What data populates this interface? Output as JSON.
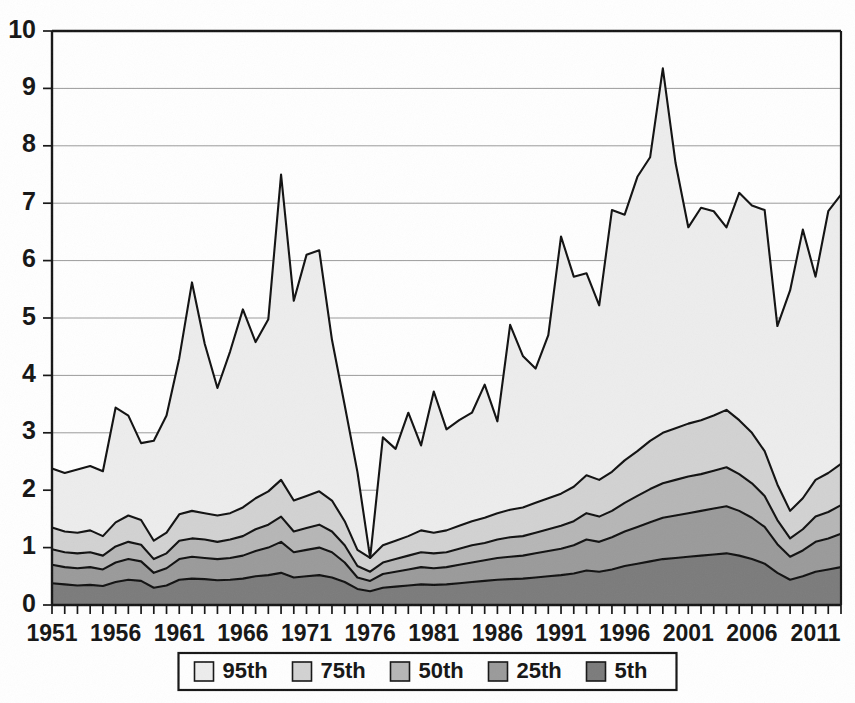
{
  "chart_data": {
    "type": "area",
    "stacked": true,
    "title": "",
    "subtitle": "",
    "xlabel": "",
    "ylabel": "",
    "xlim": [
      1951,
      2013
    ],
    "ylim": [
      0,
      10
    ],
    "ytick_values": [
      0,
      1,
      2,
      3,
      4,
      5,
      6,
      7,
      8,
      9,
      10
    ],
    "ytick_labels": [
      "0",
      "1",
      "2",
      "3",
      "4",
      "5",
      "6",
      "7",
      "8",
      "9",
      "10"
    ],
    "xtick_labels": [
      "1951",
      "1956",
      "1961",
      "1966",
      "1971",
      "1976",
      "1981",
      "1986",
      "1991",
      "1996",
      "2001",
      "2006",
      "2011"
    ],
    "xtick_values": [
      1951,
      1956,
      1961,
      1966,
      1971,
      1976,
      1981,
      1986,
      1991,
      1996,
      2001,
      2006,
      2011
    ],
    "minor_xticks_every": 1,
    "grid": {
      "horizontal": true,
      "vertical": false
    },
    "legend": {
      "position": "bottom-center",
      "entries": [
        {
          "label": "95th",
          "color": "#ededed"
        },
        {
          "label": "75th",
          "color": "#d2d2d2"
        },
        {
          "label": "50th",
          "color": "#b6b6b6"
        },
        {
          "label": "25th",
          "color": "#9a9a9a"
        },
        {
          "label": "5th",
          "color": "#7b7b7b"
        }
      ]
    },
    "x": [
      1951,
      1952,
      1953,
      1954,
      1955,
      1956,
      1957,
      1958,
      1959,
      1960,
      1961,
      1962,
      1963,
      1964,
      1965,
      1966,
      1967,
      1968,
      1969,
      1970,
      1971,
      1972,
      1973,
      1974,
      1975,
      1976,
      1977,
      1978,
      1979,
      1980,
      1981,
      1982,
      1983,
      1984,
      1985,
      1986,
      1987,
      1988,
      1989,
      1990,
      1991,
      1992,
      1993,
      1994,
      1995,
      1996,
      1997,
      1998,
      1999,
      2000,
      2001,
      2002,
      2003,
      2004,
      2005,
      2006,
      2007,
      2008,
      2009,
      2010,
      2011,
      2012,
      2013
    ],
    "series": [
      {
        "name": "5th",
        "values": [
          0.38,
          0.36,
          0.34,
          0.35,
          0.33,
          0.4,
          0.44,
          0.42,
          0.3,
          0.34,
          0.44,
          0.46,
          0.45,
          0.43,
          0.44,
          0.46,
          0.5,
          0.52,
          0.56,
          0.48,
          0.5,
          0.52,
          0.48,
          0.4,
          0.28,
          0.24,
          0.3,
          0.32,
          0.34,
          0.36,
          0.35,
          0.36,
          0.38,
          0.4,
          0.42,
          0.44,
          0.45,
          0.46,
          0.48,
          0.5,
          0.52,
          0.55,
          0.6,
          0.58,
          0.62,
          0.68,
          0.72,
          0.76,
          0.8,
          0.82,
          0.84,
          0.86,
          0.88,
          0.9,
          0.86,
          0.8,
          0.72,
          0.56,
          0.44,
          0.5,
          0.58,
          0.62,
          0.66
        ]
      },
      {
        "name": "25th",
        "values": [
          0.7,
          0.66,
          0.64,
          0.66,
          0.62,
          0.74,
          0.8,
          0.76,
          0.56,
          0.64,
          0.8,
          0.84,
          0.82,
          0.8,
          0.82,
          0.86,
          0.94,
          1.0,
          1.1,
          0.92,
          0.96,
          1.0,
          0.92,
          0.74,
          0.48,
          0.42,
          0.54,
          0.58,
          0.62,
          0.66,
          0.64,
          0.66,
          0.7,
          0.74,
          0.78,
          0.82,
          0.84,
          0.86,
          0.9,
          0.94,
          0.98,
          1.04,
          1.14,
          1.1,
          1.18,
          1.28,
          1.36,
          1.44,
          1.52,
          1.56,
          1.6,
          1.64,
          1.68,
          1.72,
          1.64,
          1.52,
          1.36,
          1.06,
          0.84,
          0.95,
          1.1,
          1.16,
          1.24
        ]
      },
      {
        "name": "50th",
        "values": [
          0.97,
          0.92,
          0.9,
          0.92,
          0.86,
          1.02,
          1.1,
          1.05,
          0.8,
          0.9,
          1.12,
          1.16,
          1.14,
          1.1,
          1.14,
          1.2,
          1.32,
          1.4,
          1.54,
          1.28,
          1.34,
          1.4,
          1.28,
          1.04,
          0.68,
          0.58,
          0.74,
          0.8,
          0.86,
          0.92,
          0.9,
          0.92,
          0.98,
          1.04,
          1.08,
          1.14,
          1.18,
          1.2,
          1.26,
          1.32,
          1.38,
          1.46,
          1.6,
          1.54,
          1.64,
          1.78,
          1.9,
          2.02,
          2.12,
          2.18,
          2.24,
          2.28,
          2.34,
          2.4,
          2.28,
          2.12,
          1.9,
          1.48,
          1.16,
          1.32,
          1.54,
          1.62,
          1.74
        ]
      },
      {
        "name": "75th",
        "values": [
          1.35,
          1.28,
          1.26,
          1.3,
          1.2,
          1.44,
          1.56,
          1.48,
          1.12,
          1.26,
          1.58,
          1.64,
          1.6,
          1.56,
          1.6,
          1.7,
          1.86,
          1.98,
          2.18,
          1.82,
          1.9,
          1.98,
          1.82,
          1.46,
          0.96,
          0.82,
          1.04,
          1.12,
          1.2,
          1.3,
          1.26,
          1.3,
          1.38,
          1.46,
          1.52,
          1.6,
          1.66,
          1.7,
          1.78,
          1.86,
          1.94,
          2.06,
          2.26,
          2.18,
          2.32,
          2.52,
          2.68,
          2.86,
          3.0,
          3.08,
          3.16,
          3.22,
          3.3,
          3.4,
          3.22,
          3.0,
          2.68,
          2.1,
          1.64,
          1.86,
          2.18,
          2.3,
          2.46
        ]
      },
      {
        "name": "95th",
        "values": [
          2.38,
          2.3,
          2.36,
          2.42,
          2.33,
          3.44,
          3.3,
          2.82,
          2.86,
          3.3,
          4.3,
          5.62,
          4.55,
          3.78,
          4.42,
          5.15,
          4.58,
          4.98,
          7.5,
          5.3,
          6.1,
          6.18,
          4.62,
          3.48,
          2.32,
          0.82,
          2.92,
          2.72,
          3.35,
          2.78,
          3.72,
          3.06,
          3.22,
          3.35,
          3.84,
          3.2,
          4.88,
          4.34,
          4.12,
          4.7,
          6.42,
          5.72,
          5.78,
          5.22,
          6.88,
          6.8,
          7.46,
          7.8,
          9.35,
          7.7,
          6.58,
          6.92,
          6.86,
          6.58,
          7.18,
          6.96,
          6.88,
          4.86,
          5.48,
          6.54,
          5.72,
          6.86,
          7.15
        ]
      }
    ]
  }
}
